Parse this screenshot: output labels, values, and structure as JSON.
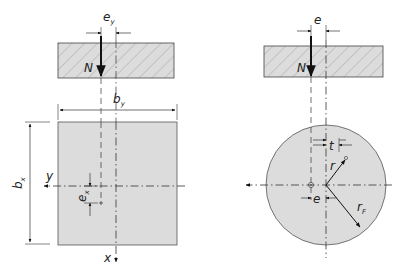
{
  "colors": {
    "fill": "#dcdcdc",
    "stroke": "#333333",
    "hatch": "#9a9a9a",
    "background": "#ffffff"
  },
  "left_figure": {
    "title": "rectangular section",
    "load_label": "N",
    "ecc_y": {
      "main": "e",
      "sub": "y"
    },
    "ecc_x": {
      "main": "e",
      "sub": "x"
    },
    "width_y": {
      "main": "b",
      "sub": "y"
    },
    "width_x": {
      "main": "b",
      "sub": "x"
    },
    "axis_y": "y",
    "axis_x": "x"
  },
  "right_figure": {
    "title": "circular section",
    "load_label": "N",
    "ecc_top": "e",
    "ecc_bottom": "e",
    "t_label": "t",
    "r_label": "r",
    "rF": {
      "main": "r",
      "sub": "F"
    }
  }
}
